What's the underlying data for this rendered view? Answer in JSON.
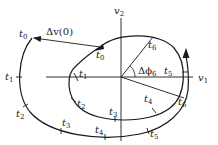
{
  "diagram": {
    "axes": {
      "horizontal": {
        "label": "v",
        "subscript": "1"
      },
      "vertical": {
        "label": "v",
        "subscript": "2"
      }
    },
    "impulse_label": {
      "text": "Δv(0)"
    },
    "angle_label": {
      "text": "Δϕ",
      "subscript": "6"
    },
    "inner_orbit_ticks": [
      {
        "label": "t",
        "subscript": "0"
      },
      {
        "label": "t",
        "subscript": "1"
      },
      {
        "label": "t",
        "subscript": "2"
      },
      {
        "label": "t",
        "subscript": "3"
      },
      {
        "label": "t",
        "subscript": "4"
      },
      {
        "label": "t",
        "subscript": "5"
      },
      {
        "label": "t",
        "subscript": "6"
      }
    ],
    "outer_orbit_ticks": [
      {
        "label": "t",
        "subscript": "0"
      },
      {
        "label": "t",
        "subscript": "1"
      },
      {
        "label": "t",
        "subscript": "2"
      },
      {
        "label": "t",
        "subscript": "3"
      },
      {
        "label": "t",
        "subscript": "4"
      },
      {
        "label": "t",
        "subscript": "5"
      },
      {
        "label": "t",
        "subscript": "6"
      }
    ]
  }
}
